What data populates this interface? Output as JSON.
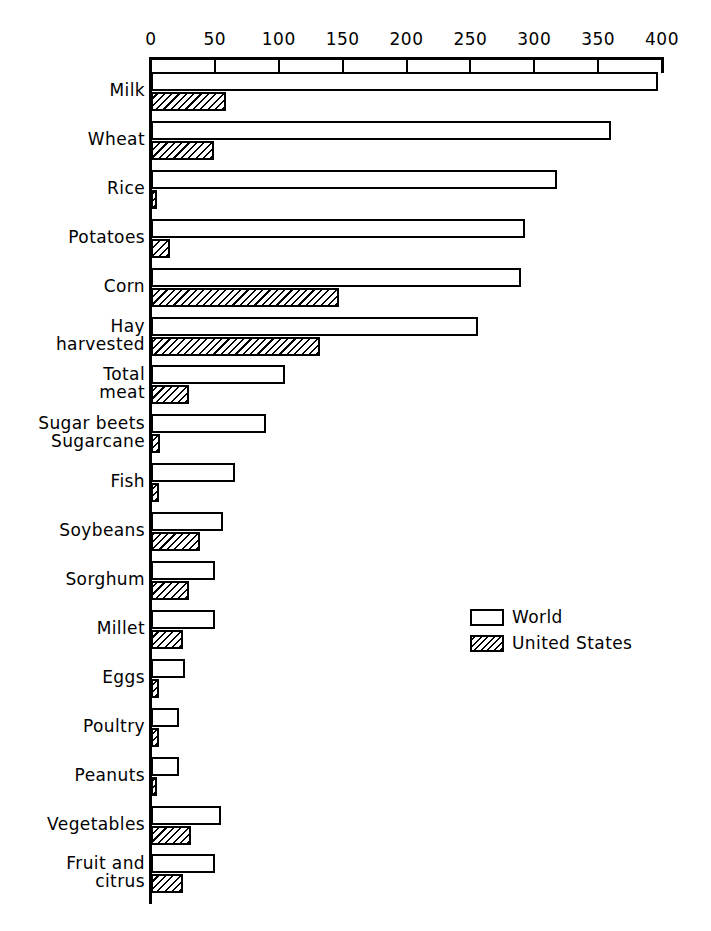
{
  "chart_data": {
    "type": "bar",
    "orientation": "horizontal",
    "title": "",
    "subtitle": "",
    "xlabel": "",
    "ylabel": "",
    "xlim": [
      0,
      400
    ],
    "xticks": [
      0,
      50,
      100,
      150,
      200,
      250,
      300,
      350,
      400
    ],
    "xtick_labels": [
      "0",
      "50",
      "100",
      "150",
      "200",
      "250",
      "300",
      "350",
      "400"
    ],
    "grid": false,
    "legend_position": "center-right",
    "categories": [
      "Milk",
      "Wheat",
      "Rice",
      "Potatoes",
      "Corn",
      "Hay\nharvested",
      "Total\nmeat",
      "Sugar beets\nSugarcane",
      "Fish",
      "Soybeans",
      "Sorghum",
      "Millet",
      "Eggs",
      "Poultry",
      "Peanuts",
      "Vegetables",
      "Fruit and\ncitrus"
    ],
    "series": [
      {
        "name": "World",
        "fill": "open",
        "values": [
          397,
          360,
          318,
          293,
          290,
          256,
          105,
          90,
          66,
          56,
          50,
          50,
          27,
          22,
          22,
          55,
          50
        ]
      },
      {
        "name": "United States",
        "fill": "hatched",
        "values": [
          59,
          49,
          5,
          15,
          147,
          132,
          30,
          7,
          6,
          38,
          30,
          25,
          6,
          6,
          5,
          31,
          25
        ]
      }
    ]
  },
  "legend": {
    "entries": [
      {
        "label": "World",
        "swatch": "open-box-icon"
      },
      {
        "label": "United States",
        "swatch": "hatched-box-icon"
      }
    ]
  },
  "colors": {
    "ink": "#000000",
    "paper": "#ffffff"
  }
}
